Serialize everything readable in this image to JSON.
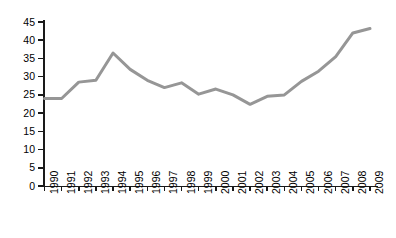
{
  "chart_data": {
    "type": "line",
    "title": "",
    "subtitle": "",
    "xlabel": "",
    "ylabel": "",
    "categories": [
      "1990",
      "1991",
      "1992",
      "1993",
      "1994",
      "1995",
      "1996",
      "1997",
      "1998",
      "1999",
      "2000",
      "2001",
      "2002",
      "2003",
      "2004",
      "2005",
      "2006",
      "2007",
      "2008",
      "2009"
    ],
    "values": [
      24,
      24,
      28.5,
      29,
      36.5,
      32,
      29,
      27,
      28.3,
      25.2,
      26.6,
      25,
      22.4,
      24.6,
      25,
      28.7,
      31.5,
      35.5,
      42,
      43.2
    ],
    "series": [
      {
        "name": "",
        "values": [
          24,
          24,
          28.5,
          29,
          36.5,
          32,
          29,
          27,
          28.3,
          25.2,
          26.6,
          25,
          22.4,
          24.6,
          25,
          28.7,
          31.5,
          35.5,
          42,
          43.2
        ]
      }
    ],
    "x": [
      "1990",
      "1991",
      "1992",
      "1993",
      "1994",
      "1995",
      "1996",
      "1997",
      "1998",
      "1999",
      "2000",
      "2001",
      "2002",
      "2003",
      "2004",
      "2005",
      "2006",
      "2007",
      "2008",
      "2009"
    ],
    "ylim": [
      0,
      45
    ],
    "yticks": [
      0,
      5,
      10,
      15,
      20,
      25,
      30,
      35,
      40,
      45
    ],
    "ytick_labels": [
      "0",
      "5",
      "10",
      "15",
      "20",
      "25",
      "30",
      "35",
      "40",
      "45"
    ],
    "xtick_labels": [
      "1990",
      "1991",
      "1992",
      "1993",
      "1994",
      "1995",
      "1996",
      "1997",
      "1998",
      "1999",
      "2000",
      "2001",
      "2002",
      "2003",
      "2004",
      "2005",
      "2006",
      "2007",
      "2008",
      "2009"
    ],
    "grid": false,
    "legend": false,
    "legend_position": "none",
    "line_color": "#969696",
    "axis_color": "#1a1a1a",
    "background_color": "#ffffff",
    "line_width": 3,
    "annotations": []
  }
}
